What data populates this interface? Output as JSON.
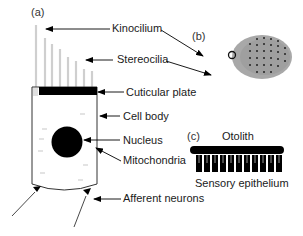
{
  "figure": {
    "panels": [
      {
        "id": "a",
        "label": "(a)"
      },
      {
        "id": "b",
        "label": "(b)"
      },
      {
        "id": "c",
        "label": "(c)"
      }
    ],
    "hair_cell_labels": {
      "kinocilium": "Kinocilium",
      "stereocilia": "Stereocilia",
      "cuticular_plate": "Cuticular plate",
      "cell_body": "Cell body",
      "nucleus": "Nucleus",
      "mitochondria": "Mitochondria",
      "afferent_neurons": "Afferent neurons"
    },
    "otolith_labels": {
      "otolith": "Otolith",
      "sensory_epithelium": "Sensory epithelium"
    },
    "colors": {
      "ink": "#000000",
      "cilia": "#d0d0d0",
      "bundle_fill": "#9a9a9a",
      "text": "#1a1a1a"
    }
  }
}
